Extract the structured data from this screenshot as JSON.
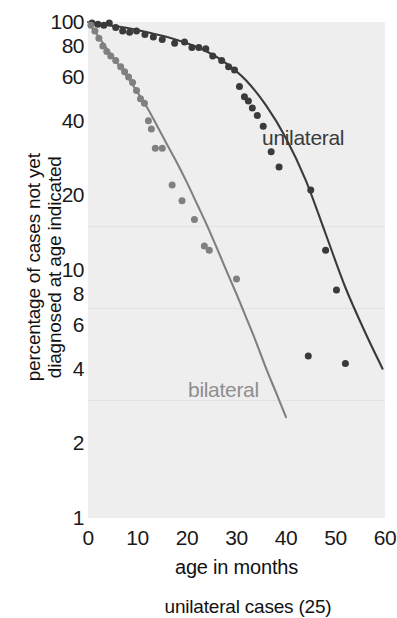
{
  "chart_data": {
    "type": "scatter",
    "title": "",
    "subtitle": "",
    "xlabel": "age in months",
    "ylabel": "percentage of cases not yet diagnosed at age indicated",
    "caption": "unilateral cases (25)",
    "xlim": [
      0,
      60
    ],
    "ylim": [
      1,
      100
    ],
    "yscale": "log",
    "xscale": "linear",
    "grid": true,
    "legend_position": "inline-annotation",
    "xticks": [
      0,
      10,
      20,
      30,
      40,
      50,
      60
    ],
    "yticks": [
      100,
      80,
      60,
      40,
      20,
      10,
      8,
      6,
      4,
      2,
      1
    ],
    "gridline_values": [
      15,
      7,
      3
    ],
    "series": [
      {
        "name": "unilateral",
        "color": "#3a3a3a",
        "marker": "circle",
        "points": [
          [
            0.8,
            99
          ],
          [
            2.0,
            98
          ],
          [
            3.2,
            97
          ],
          [
            4.3,
            99
          ],
          [
            5.6,
            95
          ],
          [
            7.0,
            92
          ],
          [
            8.4,
            91
          ],
          [
            9.8,
            92
          ],
          [
            11.5,
            89
          ],
          [
            13.2,
            87
          ],
          [
            15.0,
            85
          ],
          [
            17.5,
            82
          ],
          [
            19.5,
            83
          ],
          [
            21.0,
            79
          ],
          [
            22.4,
            79
          ],
          [
            23.8,
            78
          ],
          [
            25.2,
            73
          ],
          [
            27.0,
            70
          ],
          [
            28.4,
            66
          ],
          [
            29.6,
            64
          ],
          [
            30.6,
            55
          ],
          [
            31.6,
            50
          ],
          [
            32.4,
            48
          ],
          [
            33.2,
            45
          ],
          [
            34.2,
            42
          ],
          [
            35.4,
            38
          ],
          [
            37.0,
            30
          ],
          [
            38.6,
            26
          ],
          [
            45.0,
            21
          ],
          [
            48.0,
            12
          ],
          [
            50.2,
            8.3
          ],
          [
            44.5,
            4.5
          ],
          [
            52.0,
            4.2
          ]
        ],
        "fit_curve": [
          [
            0.0,
            100
          ],
          [
            2.0,
            98.5
          ],
          [
            5.0,
            96.5
          ],
          [
            8.0,
            94.5
          ],
          [
            12.0,
            91
          ],
          [
            16.0,
            87
          ],
          [
            20.0,
            82
          ],
          [
            24.0,
            76
          ],
          [
            28.0,
            68
          ],
          [
            32.0,
            58
          ],
          [
            36.0,
            46
          ],
          [
            40.0,
            34
          ],
          [
            44.0,
            23
          ],
          [
            48.0,
            14
          ],
          [
            52.0,
            8.5
          ],
          [
            56.0,
            5.6
          ],
          [
            59.5,
            4.0
          ]
        ]
      },
      {
        "name": "bilateral",
        "color": "#808080",
        "marker": "circle",
        "points": [
          [
            0.6,
            97
          ],
          [
            1.4,
            92
          ],
          [
            2.2,
            86
          ],
          [
            3.0,
            80
          ],
          [
            3.8,
            76
          ],
          [
            4.6,
            73
          ],
          [
            5.6,
            70
          ],
          [
            6.6,
            66
          ],
          [
            7.4,
            63
          ],
          [
            8.2,
            60
          ],
          [
            9.0,
            57
          ],
          [
            9.8,
            53
          ],
          [
            10.6,
            49
          ],
          [
            11.4,
            47
          ],
          [
            12.2,
            40
          ],
          [
            12.8,
            37
          ],
          [
            13.6,
            31
          ],
          [
            15.0,
            31
          ],
          [
            17.0,
            22
          ],
          [
            19.0,
            19
          ],
          [
            21.5,
            16
          ],
          [
            23.5,
            12.5
          ],
          [
            24.5,
            12
          ],
          [
            30.0,
            9.2
          ]
        ],
        "fit_curve": [
          [
            0.0,
            100
          ],
          [
            2.0,
            88
          ],
          [
            4.0,
            77
          ],
          [
            6.0,
            68
          ],
          [
            8.0,
            60
          ],
          [
            10.0,
            52
          ],
          [
            12.0,
            45
          ],
          [
            14.0,
            38
          ],
          [
            16.0,
            32
          ],
          [
            18.0,
            27
          ],
          [
            20.0,
            22.5
          ],
          [
            22.0,
            18.5
          ],
          [
            24.0,
            15.2
          ],
          [
            26.0,
            12.3
          ],
          [
            28.0,
            9.9
          ],
          [
            30.0,
            8.0
          ],
          [
            32.0,
            6.4
          ],
          [
            34.0,
            5.1
          ],
          [
            36.0,
            4.0
          ],
          [
            38.0,
            3.2
          ],
          [
            40.0,
            2.55
          ]
        ]
      }
    ]
  },
  "axes": {
    "y_tick_labels": [
      "100",
      "80",
      "60",
      "40",
      "20",
      "10",
      "8",
      "6",
      "4",
      "2",
      "1"
    ],
    "x_tick_labels": [
      "0",
      "10",
      "20",
      "30",
      "40",
      "50",
      "60"
    ],
    "y_title": "percentage of cases not yet<br>diagnosed at age indicated",
    "x_title": "age in months"
  },
  "annotations": {
    "unilateral_label": "unilateral",
    "bilateral_label": "bilateral",
    "caption_text": "unilateral cases (25)"
  },
  "colors": {
    "panel_background": "#eeeeee",
    "page_background": "#ffffff",
    "unilateral": "#3a3a3a",
    "bilateral": "#808080",
    "gridline": "#e2e2e2",
    "text": "#111111"
  }
}
